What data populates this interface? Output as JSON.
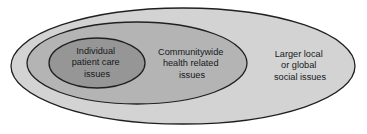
{
  "diagram": {
    "type": "nested-ellipse-venn",
    "title": "",
    "background_color": "#ffffff",
    "rings": [
      {
        "id": "outer",
        "name": "larger-local-or-global-social-issues",
        "fill_color": "#d3d3d3",
        "stroke_color": "#231f20",
        "label_lines": [
          "Larger local",
          "or global",
          "social issues"
        ],
        "label_x": 300,
        "label_y": 66,
        "cx": 183,
        "cy": 66,
        "rx": 172,
        "ry": 58
      },
      {
        "id": "middle",
        "name": "communitywide-health-related-issues",
        "fill_color": "#b4b4b4",
        "stroke_color": "#231f20",
        "label_lines": [
          "Communitywide",
          "health related",
          "issues"
        ],
        "label_x": 192,
        "label_y": 64,
        "cx": 137,
        "cy": 63,
        "rx": 110,
        "ry": 41
      },
      {
        "id": "inner",
        "name": "individual-patient-care-issues",
        "fill_color": "#969696",
        "stroke_color": "#231f20",
        "label_lines": [
          "Individual",
          "patient care",
          "issues"
        ],
        "label_x": 97,
        "label_y": 63,
        "cx": 97,
        "cy": 63,
        "rx": 48,
        "ry": 25
      }
    ]
  }
}
